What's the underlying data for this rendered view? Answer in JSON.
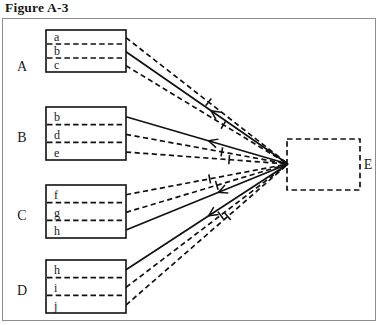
{
  "figure": {
    "title": "Figure A-3",
    "type": "convergence-diagram"
  },
  "groups": [
    {
      "id": "A",
      "label": "A",
      "label_x": 22,
      "label_y": 71,
      "box": {
        "x": 46,
        "y": 30,
        "w": 80,
        "h": 42
      },
      "rows": [
        {
          "label": "a",
          "line_style": "dashed"
        },
        {
          "label": "b",
          "line_style": "solid"
        },
        {
          "label": "c",
          "line_style": "dashed"
        }
      ]
    },
    {
      "id": "B",
      "label": "B",
      "label_x": 22,
      "label_y": 142,
      "box": {
        "x": 46,
        "y": 107,
        "w": 80,
        "h": 53
      },
      "rows": [
        {
          "label": "b",
          "line_style": "solid"
        },
        {
          "label": "d",
          "line_style": "dashed"
        },
        {
          "label": "e",
          "line_style": "dashed"
        }
      ]
    },
    {
      "id": "C",
      "label": "C",
      "label_x": 22,
      "label_y": 220,
      "box": {
        "x": 46,
        "y": 185,
        "w": 80,
        "h": 53
      },
      "rows": [
        {
          "label": "f",
          "line_style": "dashed"
        },
        {
          "label": "g",
          "line_style": "dashed"
        },
        {
          "label": "h",
          "line_style": "solid"
        }
      ]
    },
    {
      "id": "D",
      "label": "D",
      "label_x": 22,
      "label_y": 295,
      "box": {
        "x": 46,
        "y": 260,
        "w": 80,
        "h": 53
      },
      "rows": [
        {
          "label": "h",
          "line_style": "solid"
        },
        {
          "label": "i",
          "line_style": "dashed"
        },
        {
          "label": "j",
          "line_style": "dashed"
        }
      ]
    }
  ],
  "target": {
    "id": "E",
    "label": "E",
    "label_x": 368,
    "label_y": 169,
    "box": {
      "x": 287,
      "y": 139,
      "w": 73,
      "h": 51
    },
    "style": "dashed",
    "converge_point": {
      "x": 288,
      "y": 164
    }
  },
  "link_marks": {
    "arrowhead_direction": "left",
    "description": "lines converge from group boxes into box E; arrowheads and tick marks drawn along the paths"
  }
}
